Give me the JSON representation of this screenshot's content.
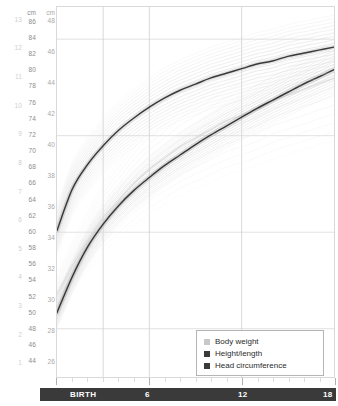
{
  "chart_data": {
    "type": "line",
    "title": "",
    "xlabel": "BIRTH",
    "ylabel": "cm",
    "xlim": [
      0,
      18
    ],
    "ylim_height_cm": [
      42,
      88
    ],
    "ylim_head_cm": [
      25,
      49
    ],
    "ylim_weight_kg": [
      0.5,
      13.5
    ],
    "grid": true,
    "legend_position": "bottom-right",
    "x_tick_labels": [
      "BIRTH",
      "6",
      "12",
      "18"
    ],
    "x_tick_values": [
      0,
      6,
      12,
      18
    ],
    "x_minor_tick_interval_months": 1,
    "axes": [
      {
        "name": "body-weight",
        "unit": "kg",
        "unit_label": "",
        "color": "#cfcfcf",
        "ticks": [
          13,
          12,
          11,
          10,
          9,
          8,
          7,
          6,
          5,
          4,
          3,
          2,
          1
        ]
      },
      {
        "name": "height-length",
        "unit": "cm",
        "unit_label": "cm",
        "color": "#8d8d8d",
        "ticks": [
          86,
          84,
          82,
          80,
          78,
          76,
          74,
          72,
          70,
          68,
          66,
          64,
          62,
          60,
          58,
          56,
          54,
          52,
          50,
          48,
          46,
          44
        ]
      },
      {
        "name": "head-circumference",
        "unit": "cm",
        "unit_label": "cm",
        "color": "#a8a8a8",
        "ticks": [
          48,
          46,
          44,
          42,
          40,
          38,
          36,
          34,
          32,
          30,
          28,
          26
        ]
      }
    ],
    "series": [
      {
        "name": "Body weight",
        "color": "#c9c9c9",
        "band_color": "#ededed",
        "x": [
          0,
          1,
          2,
          3,
          4,
          5,
          6,
          7,
          8,
          9,
          10,
          11,
          12,
          13,
          14,
          15,
          16,
          17,
          18
        ],
        "values": [
          3.4,
          4.4,
          5.3,
          6.1,
          6.7,
          7.3,
          7.8,
          8.2,
          8.6,
          8.9,
          9.2,
          9.5,
          9.7,
          9.9,
          10.2,
          10.4,
          10.6,
          10.8,
          11.0
        ]
      },
      {
        "name": "Height/length",
        "color": "#2f2f2f",
        "band_color": "#d8d8d8",
        "x": [
          0,
          1,
          2,
          3,
          4,
          5,
          6,
          7,
          8,
          9,
          10,
          11,
          12,
          13,
          14,
          15,
          16,
          17,
          18
        ],
        "values": [
          50.0,
          54.5,
          58.2,
          61.0,
          63.3,
          65.2,
          66.8,
          68.3,
          69.6,
          70.9,
          72.1,
          73.2,
          74.3,
          75.4,
          76.4,
          77.4,
          78.4,
          79.3,
          80.2
        ]
      },
      {
        "name": "Head circumference",
        "color": "#2f2f2f",
        "band_color": "#dcdcdc",
        "x": [
          0,
          1,
          2,
          3,
          4,
          5,
          6,
          7,
          8,
          9,
          10,
          11,
          12,
          13,
          14,
          15,
          16,
          17,
          18
        ],
        "values": [
          34.5,
          37.2,
          38.8,
          40.0,
          41.0,
          41.8,
          42.5,
          43.1,
          43.6,
          44.0,
          44.4,
          44.7,
          45.0,
          45.3,
          45.5,
          45.8,
          46.0,
          46.2,
          46.4
        ]
      }
    ]
  },
  "legend": {
    "items": [
      {
        "label": "Body weight",
        "color": "#c8c8c8"
      },
      {
        "label": "Height/length",
        "color": "#3a3a3a"
      },
      {
        "label": "Head circumference",
        "color": "#3a3a3a"
      }
    ]
  },
  "age_bar": {
    "labels": [
      "BIRTH",
      "6",
      "12",
      "18"
    ]
  }
}
